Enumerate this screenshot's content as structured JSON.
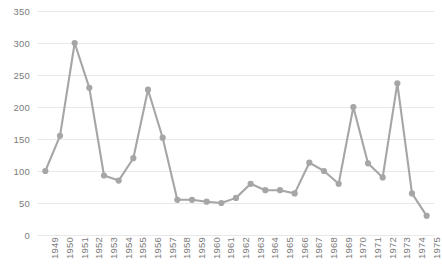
{
  "chart_data": {
    "type": "line",
    "title": "",
    "subtitle": "",
    "xlabel": "",
    "ylabel": "",
    "categories": [
      "1949",
      "1950",
      "1951",
      "1952",
      "1953",
      "1954",
      "1955",
      "1956",
      "1957",
      "1958",
      "1959",
      "1960",
      "1961",
      "1962",
      "1963",
      "1964",
      "1965",
      "1966",
      "1967",
      "1968",
      "1969",
      "1970",
      "1971",
      "1972",
      "1973",
      "1974",
      "1975"
    ],
    "values": [
      100,
      155,
      300,
      230,
      93,
      85,
      120,
      227,
      152,
      55,
      55,
      52,
      50,
      58,
      80,
      70,
      70,
      65,
      113,
      100,
      80,
      200,
      112,
      90,
      237,
      65,
      30
    ],
    "series": [
      {
        "name": "",
        "values": [
          100,
          155,
          300,
          230,
          93,
          85,
          120,
          227,
          152,
          55,
          55,
          52,
          50,
          58,
          80,
          70,
          70,
          65,
          113,
          100,
          80,
          200,
          112,
          90,
          237,
          65,
          30
        ]
      }
    ],
    "ylim": [
      0,
      350
    ],
    "yticks": [
      0,
      50,
      100,
      150,
      200,
      250,
      300,
      350
    ],
    "ytick_labels": [
      "0",
      "50",
      "100",
      "150",
      "200",
      "250",
      "300",
      "350"
    ],
    "xtick_labels": [
      "1949",
      "1950",
      "1951",
      "1952",
      "1953",
      "1954",
      "1955",
      "1956",
      "1957",
      "1958",
      "1959",
      "1960",
      "1961",
      "1962",
      "1963",
      "1964",
      "1965",
      "1966",
      "1967",
      "1968",
      "1969",
      "1970",
      "1971",
      "1972",
      "1973",
      "1974",
      "1975"
    ],
    "grid": true,
    "grid_axis": "y",
    "legend": false,
    "legend_position": "none",
    "marker": "circle",
    "annotations": []
  },
  "style": {
    "line_color": "#a6a6a6",
    "marker_color": "#a6a6a6",
    "grid_color": "#e8e8e8",
    "tick_label_color": "#7b7b7b",
    "background": "#ffffff"
  }
}
